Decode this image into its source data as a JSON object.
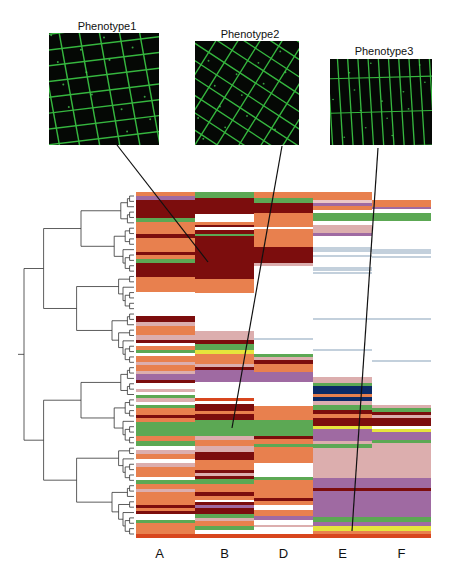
{
  "phenotypes": [
    {
      "title": "Phenotype1",
      "x": 49,
      "y": 33,
      "w": 110,
      "h": 112,
      "tx": 52,
      "ty": 20
    },
    {
      "title": "Phenotype2",
      "x": 195,
      "y": 41,
      "w": 104,
      "h": 104,
      "tx": 198,
      "ty": 28
    },
    {
      "title": "Phenotype3",
      "x": 330,
      "y": 59,
      "w": 102,
      "h": 86,
      "tx": 333,
      "ty": 45
    }
  ],
  "connectors": [
    {
      "x1": 117,
      "y1": 145,
      "x2": 208,
      "y2": 262
    },
    {
      "x1": 282,
      "y1": 146,
      "x2": 232,
      "y2": 428
    },
    {
      "x1": 378,
      "y1": 148,
      "x2": 352,
      "y2": 531
    }
  ],
  "colors": {
    "orange": "#e8804e",
    "maroon": "#7c0d0d",
    "green": "#5ca854",
    "pink": "#dcaeae",
    "purple": "#9f6aa2",
    "lightblue": "#c3d0dc",
    "navy": "#0c2a66",
    "yellow": "#e6e43c",
    "red": "#d8461e",
    "lightpink": "#ecc8c8"
  },
  "chart_data": {
    "type": "heatmap",
    "title": "",
    "columns": [
      "A",
      "B",
      "D",
      "E",
      "F"
    ],
    "column_x": [
      136,
      195,
      254,
      313,
      372
    ],
    "column_w": 59,
    "y_range": [
      192,
      540
    ],
    "phenotype_annotations": [
      {
        "label": "Phenotype1",
        "column": "A/B",
        "row_y": 262
      },
      {
        "label": "Phenotype2",
        "column": "B",
        "row_y": 428
      },
      {
        "label": "Phenotype3",
        "column": "E",
        "row_y": 531
      }
    ],
    "segments": {
      "A": [
        [
          192,
          4,
          "orange"
        ],
        [
          196,
          4,
          "purple"
        ],
        [
          200,
          18,
          "maroon"
        ],
        [
          218,
          4,
          "green"
        ],
        [
          222,
          12,
          "orange"
        ],
        [
          234,
          4,
          "maroon"
        ],
        [
          238,
          14,
          "orange"
        ],
        [
          252,
          3,
          "maroon"
        ],
        [
          255,
          4,
          "orange"
        ],
        [
          259,
          4,
          "green"
        ],
        [
          263,
          14,
          "maroon"
        ],
        [
          277,
          12,
          "orange"
        ],
        [
          289,
          3,
          "orange"
        ],
        [
          316,
          6,
          "maroon"
        ],
        [
          322,
          4,
          "pink"
        ],
        [
          326,
          9,
          "orange"
        ],
        [
          335,
          5,
          "pink"
        ],
        [
          340,
          3,
          "maroon"
        ],
        [
          343,
          3,
          "white"
        ],
        [
          346,
          4,
          "orange"
        ],
        [
          350,
          3,
          "green"
        ],
        [
          353,
          3,
          "white"
        ],
        [
          356,
          6,
          "orange"
        ],
        [
          362,
          3,
          "pink"
        ],
        [
          365,
          6,
          "orange"
        ],
        [
          371,
          3,
          "pink"
        ],
        [
          374,
          6,
          "purple"
        ],
        [
          380,
          3,
          "maroon"
        ],
        [
          389,
          3,
          "pink"
        ],
        [
          392,
          3,
          "white"
        ],
        [
          395,
          3,
          "green"
        ],
        [
          398,
          4,
          "pink"
        ],
        [
          402,
          3,
          "white"
        ],
        [
          405,
          3,
          "green"
        ],
        [
          408,
          7,
          "orange"
        ],
        [
          415,
          3,
          "maroon"
        ],
        [
          418,
          4,
          "orange"
        ],
        [
          422,
          14,
          "green"
        ],
        [
          436,
          5,
          "orange"
        ],
        [
          441,
          5,
          "green"
        ],
        [
          446,
          4,
          "white"
        ],
        [
          450,
          4,
          "pink"
        ],
        [
          454,
          5,
          "orange"
        ],
        [
          459,
          4,
          "white"
        ],
        [
          463,
          4,
          "pink"
        ],
        [
          467,
          10,
          "orange"
        ],
        [
          477,
          3,
          "white"
        ],
        [
          480,
          4,
          "green"
        ],
        [
          484,
          5,
          "orange"
        ],
        [
          489,
          3,
          "pink"
        ],
        [
          492,
          8,
          "orange"
        ],
        [
          500,
          5,
          "orange"
        ],
        [
          505,
          3,
          "maroon"
        ],
        [
          508,
          3,
          "orange"
        ],
        [
          511,
          3,
          "maroon"
        ],
        [
          514,
          6,
          "white"
        ],
        [
          520,
          3,
          "green"
        ],
        [
          523,
          11,
          "orange"
        ],
        [
          534,
          4,
          "red"
        ]
      ],
      "B": [
        [
          192,
          6,
          "green"
        ],
        [
          198,
          16,
          "maroon"
        ],
        [
          214,
          8,
          "white"
        ],
        [
          222,
          3,
          "orange"
        ],
        [
          225,
          2,
          "maroon"
        ],
        [
          227,
          3,
          "white"
        ],
        [
          230,
          4,
          "maroon"
        ],
        [
          234,
          2,
          "green"
        ],
        [
          236,
          20,
          "maroon"
        ],
        [
          256,
          23,
          "maroon"
        ],
        [
          279,
          14,
          "orange"
        ],
        [
          331,
          9,
          "pink"
        ],
        [
          340,
          4,
          "maroon"
        ],
        [
          344,
          6,
          "green"
        ],
        [
          350,
          4,
          "yellow"
        ],
        [
          354,
          10,
          "orange"
        ],
        [
          364,
          3,
          "pink"
        ],
        [
          367,
          3,
          "maroon"
        ],
        [
          370,
          6,
          "purple"
        ],
        [
          376,
          6,
          "purple"
        ],
        [
          398,
          3,
          "red"
        ],
        [
          401,
          3,
          "white"
        ],
        [
          404,
          7,
          "maroon"
        ],
        [
          411,
          3,
          "orange"
        ],
        [
          414,
          6,
          "maroon"
        ],
        [
          420,
          16,
          "green"
        ],
        [
          436,
          4,
          "pink"
        ],
        [
          440,
          6,
          "orange"
        ],
        [
          446,
          6,
          "pink"
        ],
        [
          452,
          8,
          "maroon"
        ],
        [
          460,
          10,
          "orange"
        ],
        [
          470,
          3,
          "maroon"
        ],
        [
          473,
          3,
          "pink"
        ],
        [
          476,
          3,
          "maroon"
        ],
        [
          479,
          5,
          "green"
        ],
        [
          484,
          8,
          "orange"
        ],
        [
          492,
          4,
          "maroon"
        ],
        [
          496,
          4,
          "orange"
        ],
        [
          502,
          3,
          "maroon"
        ],
        [
          505,
          3,
          "purple"
        ],
        [
          508,
          6,
          "maroon"
        ],
        [
          514,
          4,
          "green"
        ],
        [
          518,
          3,
          "pink"
        ],
        [
          521,
          5,
          "orange"
        ],
        [
          526,
          4,
          "green"
        ],
        [
          530,
          4,
          "white"
        ],
        [
          534,
          4,
          "red"
        ]
      ],
      "D": [
        [
          192,
          6,
          "orange"
        ],
        [
          198,
          5,
          "green"
        ],
        [
          203,
          10,
          "maroon"
        ],
        [
          213,
          14,
          "orange"
        ],
        [
          227,
          2,
          "white"
        ],
        [
          229,
          18,
          "orange"
        ],
        [
          247,
          16,
          "maroon"
        ],
        [
          263,
          3,
          "pink"
        ],
        [
          338,
          2,
          "lightblue"
        ],
        [
          354,
          3,
          "green"
        ],
        [
          357,
          3,
          "pink"
        ],
        [
          360,
          4,
          "maroon"
        ],
        [
          364,
          8,
          "orange"
        ],
        [
          372,
          10,
          "purple"
        ],
        [
          398,
          8,
          "white"
        ],
        [
          406,
          14,
          "orange"
        ],
        [
          420,
          16,
          "green"
        ],
        [
          436,
          3,
          "maroon"
        ],
        [
          439,
          5,
          "orange"
        ],
        [
          444,
          3,
          "green"
        ],
        [
          447,
          16,
          "orange"
        ],
        [
          463,
          14,
          "white"
        ],
        [
          477,
          3,
          "green"
        ],
        [
          480,
          18,
          "orange"
        ],
        [
          498,
          3,
          "maroon"
        ],
        [
          501,
          4,
          "orange"
        ],
        [
          505,
          5,
          "white"
        ],
        [
          510,
          6,
          "orange"
        ],
        [
          516,
          4,
          "purple"
        ],
        [
          520,
          5,
          "white"
        ],
        [
          525,
          2,
          "pink"
        ],
        [
          527,
          7,
          "white"
        ],
        [
          534,
          4,
          "red"
        ]
      ],
      "E": [
        [
          192,
          8,
          "orange"
        ],
        [
          200,
          3,
          "lightpink"
        ],
        [
          203,
          3,
          "purple"
        ],
        [
          206,
          4,
          "orange"
        ],
        [
          210,
          3,
          "white"
        ],
        [
          213,
          8,
          "green"
        ],
        [
          221,
          4,
          "white"
        ],
        [
          225,
          8,
          "pink"
        ],
        [
          233,
          3,
          "purple"
        ],
        [
          247,
          5,
          "lightblue"
        ],
        [
          255,
          2,
          "lightblue"
        ],
        [
          267,
          4,
          "lightblue"
        ],
        [
          272,
          2,
          "lightblue"
        ],
        [
          318,
          2,
          "lightblue"
        ],
        [
          349,
          2,
          "lightblue"
        ],
        [
          377,
          6,
          "pink"
        ],
        [
          383,
          3,
          "green"
        ],
        [
          386,
          8,
          "navy"
        ],
        [
          394,
          3,
          "orange"
        ],
        [
          397,
          4,
          "navy"
        ],
        [
          401,
          4,
          "pink"
        ],
        [
          405,
          5,
          "green"
        ],
        [
          410,
          4,
          "maroon"
        ],
        [
          414,
          4,
          "orange"
        ],
        [
          418,
          8,
          "maroon"
        ],
        [
          426,
          3,
          "yellow"
        ],
        [
          429,
          3,
          "green"
        ],
        [
          429,
          7,
          "purple"
        ],
        [
          436,
          5,
          "purple"
        ],
        [
          441,
          3,
          "pink"
        ],
        [
          444,
          4,
          "green"
        ],
        [
          448,
          30,
          "pink"
        ],
        [
          478,
          10,
          "purple"
        ],
        [
          488,
          3,
          "maroon"
        ],
        [
          491,
          26,
          "purple"
        ],
        [
          517,
          5,
          "green"
        ],
        [
          522,
          4,
          "purple"
        ],
        [
          526,
          5,
          "yellow"
        ],
        [
          531,
          3,
          "orange"
        ],
        [
          534,
          4,
          "red"
        ]
      ],
      "F": [
        [
          200,
          7,
          "orange"
        ],
        [
          207,
          2,
          "purple"
        ],
        [
          213,
          8,
          "green"
        ],
        [
          249,
          5,
          "lightblue"
        ],
        [
          256,
          2,
          "lightblue"
        ],
        [
          318,
          2,
          "lightblue"
        ],
        [
          360,
          2,
          "lightblue"
        ],
        [
          405,
          3,
          "pink"
        ],
        [
          408,
          4,
          "green"
        ],
        [
          412,
          3,
          "maroon"
        ],
        [
          415,
          3,
          "pink"
        ],
        [
          418,
          8,
          "maroon"
        ],
        [
          426,
          3,
          "white"
        ],
        [
          429,
          3,
          "yellow"
        ],
        [
          432,
          8,
          "purple"
        ],
        [
          440,
          3,
          "green"
        ],
        [
          443,
          5,
          "pink"
        ],
        [
          448,
          30,
          "pink"
        ],
        [
          478,
          10,
          "purple"
        ],
        [
          488,
          3,
          "maroon"
        ],
        [
          491,
          26,
          "purple"
        ],
        [
          517,
          5,
          "green"
        ],
        [
          522,
          4,
          "purple"
        ],
        [
          526,
          5,
          "yellow"
        ],
        [
          531,
          3,
          "orange"
        ],
        [
          534,
          4,
          "red"
        ]
      ]
    },
    "dendrogram": {
      "x_left": 24,
      "x_right": 134,
      "y_top": 192,
      "y_bottom": 538
    }
  }
}
